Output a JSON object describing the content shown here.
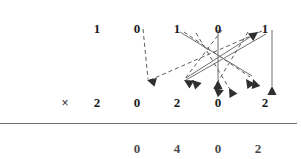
{
  "diagram": {
    "rows": {
      "multiplicand": {
        "label": "top-row",
        "digits": [
          {
            "value": "1",
            "x": 97,
            "y": 22
          },
          {
            "value": "0",
            "x": 137,
            "y": 22
          },
          {
            "value": "1",
            "x": 177,
            "y": 22
          },
          {
            "value": "0",
            "x": 218,
            "y": 22
          },
          {
            "value": "1",
            "x": 265,
            "y": 22
          }
        ]
      },
      "multiplier": {
        "label": "multiply-row",
        "operator": "×",
        "operator_x": 65,
        "operator_y": 96,
        "digits": [
          {
            "value": "2",
            "x": 97,
            "y": 96
          },
          {
            "value": "0",
            "x": 137,
            "y": 96
          },
          {
            "value": "2",
            "x": 177,
            "y": 96
          },
          {
            "value": "0",
            "x": 218,
            "y": 96
          },
          {
            "value": "2",
            "x": 265,
            "y": 96
          }
        ]
      },
      "result": {
        "label": "result-row",
        "digits": [
          {
            "value": "0",
            "x": 137,
            "y": 142
          },
          {
            "value": "4",
            "x": 177,
            "y": 142
          },
          {
            "value": "0",
            "x": 218,
            "y": 142
          },
          {
            "value": "2",
            "x": 258,
            "y": 142
          }
        ]
      }
    },
    "rule": {
      "x1": 0,
      "y": 123,
      "x2": 297
    },
    "colors": {
      "digit": "#1b1b1b",
      "result_digit": "#4a4a4a",
      "rule": "#6e6e6e",
      "arrow_dashed": "#5b5b5b",
      "arrow_solid": "#6f6f6f",
      "arrow_dark": "#2f2f2f",
      "background": "#ffffff"
    },
    "arrows": [
      {
        "name": "dashed-0-to-left-target",
        "style": "dashed",
        "color": "#5b5b5b",
        "x1": 143,
        "y1": 29,
        "x2": 148,
        "y2": 79
      },
      {
        "name": "dashed-1-to-far-left",
        "style": "dashed",
        "color": "#5b5b5b",
        "x1": 262,
        "y1": 31,
        "x2": 150,
        "y2": 80
      },
      {
        "name": "dashed-crossing-a",
        "style": "dashed",
        "color": "#5b5b5b",
        "x1": 222,
        "y1": 30,
        "x2": 184,
        "y2": 80
      },
      {
        "name": "dashed-crossing-b",
        "style": "dashed",
        "color": "#5b5b5b",
        "x1": 184,
        "y1": 32,
        "x2": 250,
        "y2": 77
      },
      {
        "name": "dashed-crossing-c",
        "style": "dashed",
        "color": "#5b5b5b",
        "x1": 248,
        "y1": 32,
        "x2": 214,
        "y2": 88
      },
      {
        "name": "dashed-crossing-d",
        "style": "dashed",
        "color": "#5b5b5b",
        "x1": 196,
        "y1": 33,
        "x2": 229,
        "y2": 88
      },
      {
        "name": "solid-1-to-right",
        "style": "solid",
        "color": "#6f6f6f",
        "x1": 180,
        "y1": 32,
        "x2": 252,
        "y2": 76
      },
      {
        "name": "solid-up-right-diagonal",
        "style": "solid",
        "color": "#6f6f6f",
        "x1": 186,
        "y1": 78,
        "x2": 258,
        "y2": 32
      },
      {
        "name": "solid-vertical-0",
        "style": "solid",
        "color": "#6f6f6f",
        "x1": 218,
        "y1": 30,
        "x2": 218,
        "y2": 80
      },
      {
        "name": "solid-vertical-1",
        "style": "solid",
        "color": "#6f6f6f",
        "x1": 272,
        "y1": 30,
        "x2": 272,
        "y2": 86
      },
      {
        "name": "solid-right-to-left",
        "style": "solid",
        "color": "#6f6f6f",
        "x1": 266,
        "y1": 34,
        "x2": 186,
        "y2": 80
      }
    ],
    "arrow_heads": [
      {
        "name": "arrowhead-over-0-left",
        "x": 147,
        "y": 80,
        "angle": 195
      },
      {
        "name": "arrowhead-over-2-a",
        "x": 184,
        "y": 80,
        "angle": 210
      },
      {
        "name": "arrowhead-over-2-b",
        "x": 192,
        "y": 80,
        "angle": 225
      },
      {
        "name": "arrowhead-over-0-mid-a",
        "x": 214,
        "y": 88,
        "angle": 220
      },
      {
        "name": "arrowhead-over-0-mid-b",
        "x": 229,
        "y": 88,
        "angle": 240
      },
      {
        "name": "arrowhead-over-2-right-a",
        "x": 246,
        "y": 79,
        "angle": 235
      },
      {
        "name": "arrowhead-over-2-right-b",
        "x": 253,
        "y": 79,
        "angle": 250
      },
      {
        "name": "arrowhead-vertical-0",
        "x": 218,
        "y": 80,
        "angle": 270
      },
      {
        "name": "arrowhead-vertical-1",
        "x": 272,
        "y": 86,
        "angle": 270
      },
      {
        "name": "arrowhead-up-right",
        "x": 258,
        "y": 32,
        "angle": 325
      }
    ]
  }
}
